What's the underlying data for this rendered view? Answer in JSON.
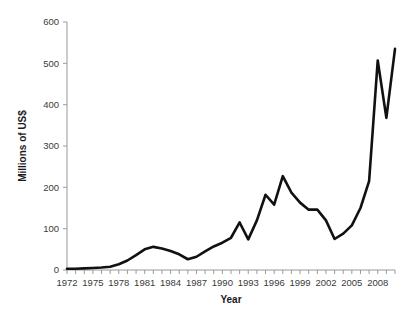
{
  "chart_data": {
    "type": "line",
    "title": "",
    "xlabel": "Year",
    "ylabel": "Millions of US$",
    "xlim": [
      1972,
      2010
    ],
    "ylim": [
      0,
      600
    ],
    "grid": false,
    "legend": "none",
    "y_ticks": [
      0,
      100,
      200,
      300,
      400,
      500,
      600
    ],
    "y_tick_labels": [
      "0",
      "100",
      "200",
      "300",
      "400",
      "500",
      "600"
    ],
    "x_ticks": [
      1972,
      1975,
      1978,
      1981,
      1984,
      1987,
      1990,
      1993,
      1996,
      1999,
      2002,
      2005,
      2008
    ],
    "x_tick_labels": [
      "1972",
      "1975",
      "1978",
      "1981",
      "1984",
      "1987",
      "1990",
      "1993",
      "1996",
      "1999",
      "2002",
      "2005",
      "2008"
    ],
    "x_minor_tick_step": 1,
    "line_color": "#111111",
    "axis_color": "#9a9a9a",
    "text_color": "#3a3a3a",
    "background_color": "#ffffff",
    "x": [
      1972,
      1973,
      1974,
      1975,
      1976,
      1977,
      1978,
      1979,
      1980,
      1981,
      1982,
      1983,
      1984,
      1985,
      1986,
      1987,
      1988,
      1989,
      1990,
      1991,
      1992,
      1993,
      1994,
      1995,
      1996,
      1997,
      1998,
      1999,
      2000,
      2001,
      2002,
      2003,
      2004,
      2005,
      2006,
      2007,
      2008,
      2009,
      2010
    ],
    "values": [
      3,
      3,
      4,
      5,
      6,
      8,
      14,
      23,
      36,
      50,
      56,
      52,
      46,
      38,
      26,
      32,
      45,
      57,
      66,
      78,
      115,
      74,
      120,
      182,
      158,
      227,
      187,
      163,
      146,
      146,
      120,
      75,
      88,
      108,
      150,
      215,
      507,
      368,
      535
    ],
    "series": [
      {
        "name": "Millions of US$",
        "values": [
          3,
          3,
          4,
          5,
          6,
          8,
          14,
          23,
          36,
          50,
          56,
          52,
          46,
          38,
          26,
          32,
          45,
          57,
          66,
          78,
          115,
          74,
          120,
          182,
          158,
          227,
          187,
          163,
          146,
          146,
          120,
          75,
          88,
          108,
          150,
          215,
          507,
          368,
          535
        ]
      }
    ]
  },
  "plot": {
    "left": 67,
    "right": 395,
    "top": 22,
    "bottom": 270
  }
}
